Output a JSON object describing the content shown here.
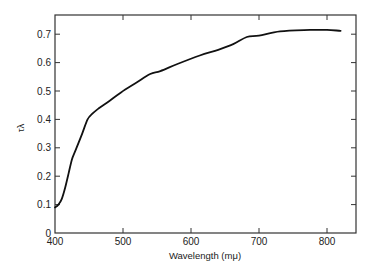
{
  "chart_data": {
    "type": "line",
    "title": "",
    "xlabel": "Wavelength (mμ)",
    "ylabel": "τλ",
    "xlim": [
      400,
      840
    ],
    "ylim": [
      0,
      0.75
    ],
    "xticks": [
      400,
      500,
      600,
      700,
      800
    ],
    "yticks": [
      0,
      0.1,
      0.2,
      0.3,
      0.4,
      0.5,
      0.6,
      0.7
    ],
    "xtick_labels": [
      "400",
      "500",
      "600",
      "700",
      "800"
    ],
    "ytick_labels": [
      "0",
      "0.1",
      "0.2",
      "0.3",
      "0.4",
      "0.5",
      "0.6",
      "0.7"
    ],
    "grid": false,
    "legend": null,
    "series": [
      {
        "name": "τλ",
        "x": [
          400,
          405,
          410,
          415,
          420,
          425,
          430,
          440,
          448,
          455,
          465,
          480,
          497,
          520,
          540,
          555,
          580,
          613,
          640,
          662,
          682,
          700,
          731,
          775,
          800,
          820
        ],
        "y": [
          0.09,
          0.1,
          0.12,
          0.16,
          0.21,
          0.26,
          0.29,
          0.35,
          0.4,
          0.42,
          0.44,
          0.465,
          0.495,
          0.53,
          0.56,
          0.57,
          0.595,
          0.625,
          0.645,
          0.665,
          0.69,
          0.695,
          0.71,
          0.715,
          0.715,
          0.712
        ]
      }
    ]
  }
}
